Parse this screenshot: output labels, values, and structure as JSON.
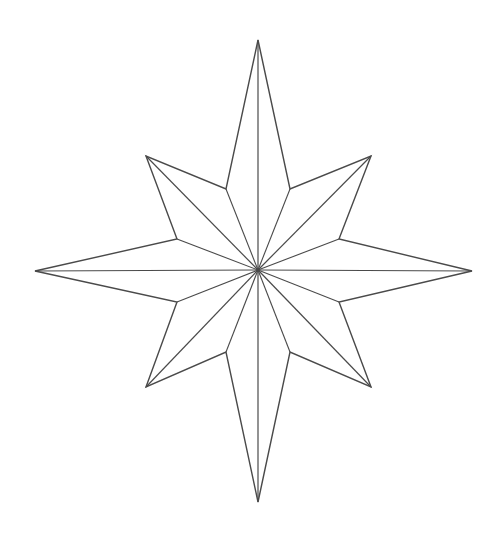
{
  "image": {
    "subject": "eight-pointed compass star line drawing",
    "stroke_color": "#4a4a4a",
    "background_color": "#ffffff",
    "center": [
      258,
      270
    ],
    "outer_points": {
      "north": [
        258,
        40
      ],
      "northeast": [
        371,
        156
      ],
      "east": [
        472,
        271
      ],
      "southeast": [
        371,
        387
      ],
      "south": [
        258,
        502
      ],
      "southwest": [
        146,
        387
      ],
      "west": [
        35,
        271
      ],
      "northwest": [
        146,
        156
      ]
    },
    "inner_points": [
      [
        290,
        189
      ],
      [
        339,
        239
      ],
      [
        339,
        302
      ],
      [
        290,
        352
      ],
      [
        226,
        352
      ],
      [
        177,
        302
      ],
      [
        177,
        239
      ],
      [
        226,
        189
      ]
    ]
  }
}
